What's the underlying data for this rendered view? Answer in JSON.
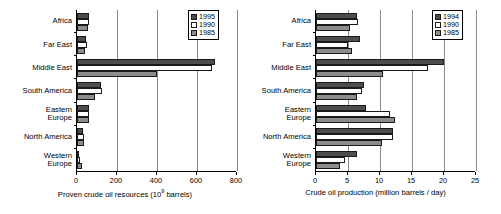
{
  "chart_data": [
    {
      "id": "proven-crude-oil-resources",
      "type": "bar",
      "orientation": "horizontal",
      "title": "",
      "xlabel": "Proven crude oil resources (10⁹ barrels)",
      "xlabel_main": "Proven crude oil resources (10",
      "xlabel_sup": "9",
      "xlabel_tail": " barrels)",
      "ylabel": "",
      "categories": [
        "Africa",
        "Far East",
        "Middle East",
        "South America",
        "Eastern Europe",
        "North America",
        "Western Europe"
      ],
      "category_lines": [
        [
          "Africa"
        ],
        [
          "Far East"
        ],
        [
          "Middle East"
        ],
        [
          "South America"
        ],
        [
          "Eastern",
          "Europe"
        ],
        [
          "North America"
        ],
        [
          "Western",
          "Europe"
        ]
      ],
      "series": [
        {
          "name": "1995",
          "color": "#4d4d4d",
          "values": [
            62,
            44,
            690,
            120,
            59,
            31,
            9
          ]
        },
        {
          "name": "1990",
          "color": "#ffffff",
          "values": [
            59,
            48,
            675,
            125,
            58,
            35,
            15
          ]
        },
        {
          "name": "1985",
          "color": "#8c8c8c",
          "values": [
            55,
            38,
            400,
            90,
            60,
            36,
            25
          ]
        }
      ],
      "xticks": [
        0,
        200,
        400,
        600,
        800
      ],
      "xlim": [
        0,
        800
      ],
      "grid": true,
      "legend_position": "top-right",
      "legend_entries": [
        "1995",
        "1990",
        "1985"
      ]
    },
    {
      "id": "crude-oil-production",
      "type": "bar",
      "orientation": "horizontal",
      "title": "",
      "xlabel": "Crude oil production (million barrels / day)",
      "xlabel_main": "Crude oil production (million barrels / day)",
      "xlabel_sup": "",
      "xlabel_tail": "",
      "ylabel": "",
      "categories": [
        "Africa",
        "Far East",
        "Middle East",
        "South America",
        "Eastern Europe",
        "North America",
        "Western Europe"
      ],
      "category_lines": [
        [
          "Africa"
        ],
        [
          "Far East"
        ],
        [
          "Middle East"
        ],
        [
          "South America"
        ],
        [
          "Eastern",
          "Europe"
        ],
        [
          "North America"
        ],
        [
          "Western",
          "Europe"
        ]
      ],
      "series": [
        {
          "name": "1994",
          "color": "#4d4d4d",
          "values": [
            6.4,
            6.9,
            20.0,
            7.5,
            7.8,
            12.1,
            6.4
          ]
        },
        {
          "name": "1990",
          "color": "#ffffff",
          "values": [
            6.6,
            5.0,
            17.5,
            7.2,
            11.5,
            12.0,
            4.6
          ]
        },
        {
          "name": "1985",
          "color": "#8c8c8c",
          "values": [
            5.3,
            5.6,
            10.4,
            6.4,
            12.3,
            10.3,
            3.7
          ]
        }
      ],
      "xticks": [
        0,
        5,
        10,
        15,
        20,
        25
      ],
      "xlim": [
        0,
        25
      ],
      "grid": true,
      "legend_position": "top-right",
      "legend_entries": [
        "1994",
        "1990",
        "1985"
      ]
    }
  ]
}
